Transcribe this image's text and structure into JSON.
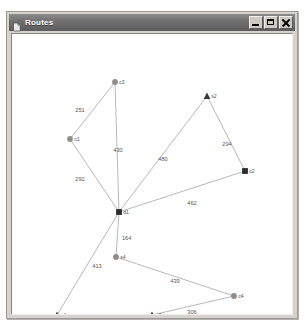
{
  "window": {
    "title": "Routes",
    "icon": "document-icon",
    "controls": {
      "minimize_label": "",
      "maximize_label": "",
      "close_label": ""
    }
  },
  "diagram": {
    "type": "network-graph",
    "canvas": {
      "width": 280,
      "height": 280
    },
    "nodes": [
      {
        "id": "c3",
        "label": "c3",
        "shape": "circle",
        "x": 103,
        "y": 48
      },
      {
        "id": "s2",
        "label": "s2",
        "shape": "triangle",
        "x": 195,
        "y": 62
      },
      {
        "id": "c1",
        "label": "c1",
        "shape": "circle",
        "x": 58,
        "y": 105
      },
      {
        "id": "c2",
        "label": "c2",
        "shape": "square",
        "x": 233,
        "y": 137
      },
      {
        "id": "d1",
        "label": "d1",
        "shape": "square",
        "x": 107,
        "y": 178
      },
      {
        "id": "s4",
        "label": "s4",
        "shape": "circle",
        "x": 104,
        "y": 223
      },
      {
        "id": "c4",
        "label": "c4",
        "shape": "circle",
        "x": 222,
        "y": 262
      },
      {
        "id": "s1",
        "label": "s1",
        "shape": "triangle",
        "x": 45,
        "y": 281
      },
      {
        "id": "s3",
        "label": "s3",
        "shape": "triangle",
        "x": 140,
        "y": 281
      }
    ],
    "edges": [
      {
        "from": "c1",
        "to": "c3",
        "weight": "251",
        "label_x": 68,
        "label_y": 78
      },
      {
        "from": "c3",
        "to": "d1",
        "weight": "430",
        "label_x": 106,
        "label_y": 118
      },
      {
        "from": "c1",
        "to": "d1",
        "weight": "292",
        "label_x": 68,
        "label_y": 147
      },
      {
        "from": "d1",
        "to": "s2",
        "weight": "480",
        "label_x": 151,
        "label_y": 127
      },
      {
        "from": "s2",
        "to": "c2",
        "weight": "294",
        "label_x": 215,
        "label_y": 112
      },
      {
        "from": "d1",
        "to": "c2",
        "weight": "462",
        "label_x": 180,
        "label_y": 171
      },
      {
        "from": "d1",
        "to": "s4",
        "weight": "164",
        "label_x": 110,
        "halign": "start",
        "label_y": 206
      },
      {
        "from": "d1",
        "to": "s1",
        "weight": "413",
        "label_x": 85,
        "label_y": 234
      },
      {
        "from": "s1",
        "to": "s3",
        "weight": "308",
        "label_x": 90,
        "label_y": 287
      },
      {
        "from": "s4",
        "to": "c4",
        "weight": "439",
        "label_x": 163,
        "label_y": 249
      },
      {
        "from": "s3",
        "to": "c4",
        "weight": "306",
        "label_x": 180,
        "label_y": 280
      }
    ]
  }
}
